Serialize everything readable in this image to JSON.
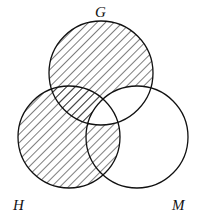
{
  "diagram": {
    "type": "venn",
    "sets": [
      {
        "id": "G",
        "label": "G",
        "cx": 101,
        "cy": 73,
        "r": 52
      },
      {
        "id": "H",
        "label": "H",
        "cx": 69,
        "cy": 137,
        "r": 51
      },
      {
        "id": "M",
        "label": "M",
        "cx": 137,
        "cy": 137,
        "r": 51
      }
    ],
    "shaded_regions": [
      "G only",
      "H only",
      "G∩H not M",
      "H∩M not G"
    ],
    "unshaded_regions": [
      "M only",
      "G∩M not H",
      "G∩H∩M"
    ],
    "colors": {
      "stroke": "#111111",
      "hatch": "#111111",
      "background": "#ffffff"
    }
  }
}
